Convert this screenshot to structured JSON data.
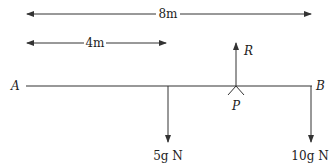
{
  "diagram": {
    "type": "beam-moments",
    "beam": {
      "left_label": "A",
      "right_label": "B"
    },
    "pivot": {
      "label": "P"
    },
    "reaction": {
      "label": "R"
    },
    "dimensions": [
      {
        "label": "8m",
        "from": "A",
        "to": "B"
      },
      {
        "label": "4m",
        "from": "A",
        "to": "5g load"
      }
    ],
    "loads": [
      {
        "label": "5g N",
        "position": "4m from A"
      },
      {
        "label": "10g N",
        "position": "at B"
      }
    ],
    "colors": {
      "line": "#333333",
      "text": "#222222"
    }
  }
}
